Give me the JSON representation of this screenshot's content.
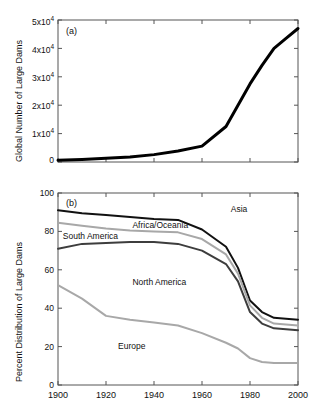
{
  "figure": {
    "panel_a_id": "(a)",
    "panel_b_id": "(b)"
  },
  "chart_data": [
    {
      "type": "line",
      "panel": "(a)",
      "title": "",
      "xlabel": "",
      "ylabel": "Global Number of Large Dams",
      "xlim": [
        1900,
        2000
      ],
      "ylim": [
        0,
        50000
      ],
      "grid": false,
      "legend": "none",
      "xticks": [
        1900,
        1920,
        1940,
        1960,
        1980,
        2000
      ],
      "xticklabels": [
        "",
        "",
        "",
        "",
        "",
        ""
      ],
      "yticks": [
        0,
        10000,
        20000,
        30000,
        40000,
        50000
      ],
      "yticklabels": [
        "0",
        "1x10",
        "2x10",
        "3x10",
        "4x10",
        "5x10"
      ],
      "ytick_exponent": "4",
      "series": [
        {
          "name": "Global number of large dams",
          "color": "#000000",
          "linewidth": 3,
          "x": [
            1900,
            1910,
            1920,
            1930,
            1940,
            1950,
            1960,
            1970,
            1975,
            1980,
            1985,
            1990,
            1995,
            2000
          ],
          "values": [
            600,
            900,
            1300,
            1800,
            2600,
            3900,
            5600,
            12500,
            20000,
            27500,
            34000,
            40000,
            43500,
            47000
          ]
        }
      ]
    },
    {
      "type": "line",
      "panel": "(b)",
      "title": "",
      "xlabel": "",
      "ylabel": "Percent Distribution of Large Dams",
      "xlim": [
        1900,
        2000
      ],
      "ylim": [
        0,
        100
      ],
      "grid": false,
      "legend": "inline-annotations",
      "xticks": [
        1900,
        1920,
        1940,
        1960,
        1980,
        2000
      ],
      "xticklabels": [
        "1900",
        "1920",
        "1940",
        "1960",
        "1980",
        "2000"
      ],
      "yticks": [
        0,
        20,
        40,
        60,
        80,
        100
      ],
      "yticklabels": [
        "0",
        "20",
        "40",
        "60",
        "80",
        "100"
      ],
      "x": [
        1900,
        1910,
        1920,
        1930,
        1940,
        1950,
        1960,
        1970,
        1975,
        1980,
        1985,
        1990,
        1995,
        2000
      ],
      "series": [
        {
          "name": "Asia",
          "color": "#111111",
          "linewidth": 2,
          "values": [
            91,
            89.5,
            88.5,
            87.5,
            86.5,
            86,
            81,
            72,
            61,
            44,
            38,
            35,
            34.5,
            34
          ]
        },
        {
          "name": "Africa/Oceania",
          "color": "#a8a8a8",
          "linewidth": 2,
          "values": [
            84.5,
            83,
            81.5,
            80.5,
            80,
            79.5,
            76,
            68,
            58,
            41.5,
            35,
            32,
            31.5,
            31
          ]
        },
        {
          "name": "South America",
          "color": "#3d3d3d",
          "linewidth": 2,
          "values": [
            71,
            73.5,
            74,
            74.5,
            74.5,
            73.5,
            70,
            63,
            54,
            38,
            32,
            29.5,
            29,
            28.5
          ]
        },
        {
          "name": "Europe",
          "color": "#a8a8a8",
          "linewidth": 2,
          "values": [
            52,
            45,
            36,
            34,
            32.5,
            31,
            27,
            22,
            19,
            14,
            12,
            11.5,
            11.5,
            11.5
          ]
        }
      ],
      "annotations": [
        {
          "text": "Asia",
          "x": 1972,
          "y": 91
        },
        {
          "text": "Africa/Oceania",
          "x": 1931,
          "y": 83
        },
        {
          "text": "South America",
          "x": 1902,
          "y": 77
        },
        {
          "text": "North America",
          "x": 1931,
          "y": 53
        },
        {
          "text": "Europe",
          "x": 1925,
          "y": 20
        }
      ]
    }
  ]
}
